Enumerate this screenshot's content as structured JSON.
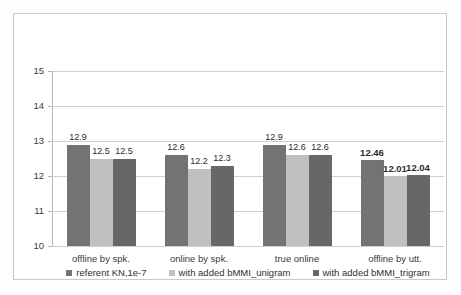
{
  "chart_data": {
    "type": "bar",
    "title": "",
    "subtitle": "",
    "xlabel": "",
    "ylabel": "",
    "ylim": [
      10,
      15
    ],
    "yticks": [
      "10",
      "11",
      "12",
      "13",
      "14",
      "15"
    ],
    "grid": true,
    "legend_position": "bottom",
    "categories": [
      "offline by spk.",
      "online by spk.",
      "true online",
      "offline by utt."
    ],
    "series": [
      {
        "name": "referent KN,1e-7",
        "color": "#737373",
        "values": [
          12.9,
          12.6,
          12.9,
          12.46
        ],
        "labels": [
          "12.9",
          "12.6",
          "12.9",
          "12.46"
        ]
      },
      {
        "name": "with added bMMI_unigram",
        "color": "#c0c0c0",
        "values": [
          12.5,
          12.2,
          12.6,
          12.01
        ],
        "labels": [
          "12.5",
          "12.2",
          "12.6",
          "12.01"
        ]
      },
      {
        "name": "with added bMMI_trigram",
        "color": "#676767",
        "values": [
          12.5,
          12.3,
          12.6,
          12.04
        ],
        "labels": [
          "12.5",
          "12.3",
          "12.6",
          "12.04"
        ]
      }
    ]
  }
}
